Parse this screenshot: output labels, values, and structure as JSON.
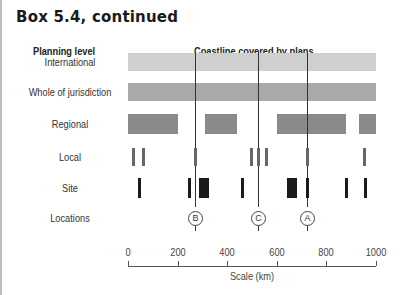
{
  "title": "Box 5.4, continued",
  "headers": {
    "left": "Planning level",
    "right": "Coastline covered by plans"
  },
  "rows": [
    {
      "label": "International",
      "y": 62
    },
    {
      "label": "Whole of jurisdiction",
      "y": 92
    },
    {
      "label": "Regional",
      "y": 124
    },
    {
      "label": "Local",
      "y": 157
    },
    {
      "label": "Site",
      "y": 188
    },
    {
      "label": "Locations",
      "y": 218
    }
  ],
  "locations": [
    {
      "id": "B",
      "km": 270
    },
    {
      "id": "C",
      "km": 525
    },
    {
      "id": "A",
      "km": 720
    }
  ],
  "axis": {
    "title": "Scale (km)",
    "ticks": [
      "0",
      "200",
      "400",
      "600",
      "800",
      "1000"
    ]
  },
  "colors": {
    "international": "#cfcfcf",
    "whole": "#a9a9a9",
    "regional": "#8a8a8a",
    "local": "#666666",
    "site": "#1a1a1a"
  },
  "chart_data": {
    "type": "table",
    "title": "Coastline covered by plans",
    "xlabel": "Scale (km)",
    "xlim": [
      0,
      1000
    ],
    "series": [
      {
        "name": "International",
        "segments": [
          [
            0,
            1000
          ]
        ]
      },
      {
        "name": "Whole of jurisdiction",
        "segments": [
          [
            0,
            1000
          ]
        ]
      },
      {
        "name": "Regional",
        "segments": [
          [
            0,
            200
          ],
          [
            310,
            440
          ],
          [
            600,
            880
          ],
          [
            930,
            1000
          ]
        ]
      },
      {
        "name": "Local",
        "marks_km": [
          20,
          60,
          270,
          495,
          525,
          555,
          720,
          950
        ]
      },
      {
        "name": "Site",
        "marks_km": [
          45,
          245,
          290,
          300,
          310,
          320,
          460,
          645,
          655,
          665,
          675,
          720,
          880,
          955
        ]
      },
      {
        "name": "Locations",
        "marks": [
          {
            "id": "B",
            "km": 270
          },
          {
            "id": "C",
            "km": 525
          },
          {
            "id": "A",
            "km": 720
          }
        ]
      }
    ]
  }
}
